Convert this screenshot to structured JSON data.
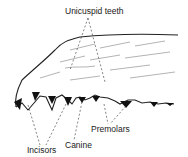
{
  "diagram": {
    "labels": {
      "unicuspid": "Unicuspid teeth",
      "incisors": "Incisors",
      "canine": "Canine",
      "premolars": "Premolars"
    }
  }
}
